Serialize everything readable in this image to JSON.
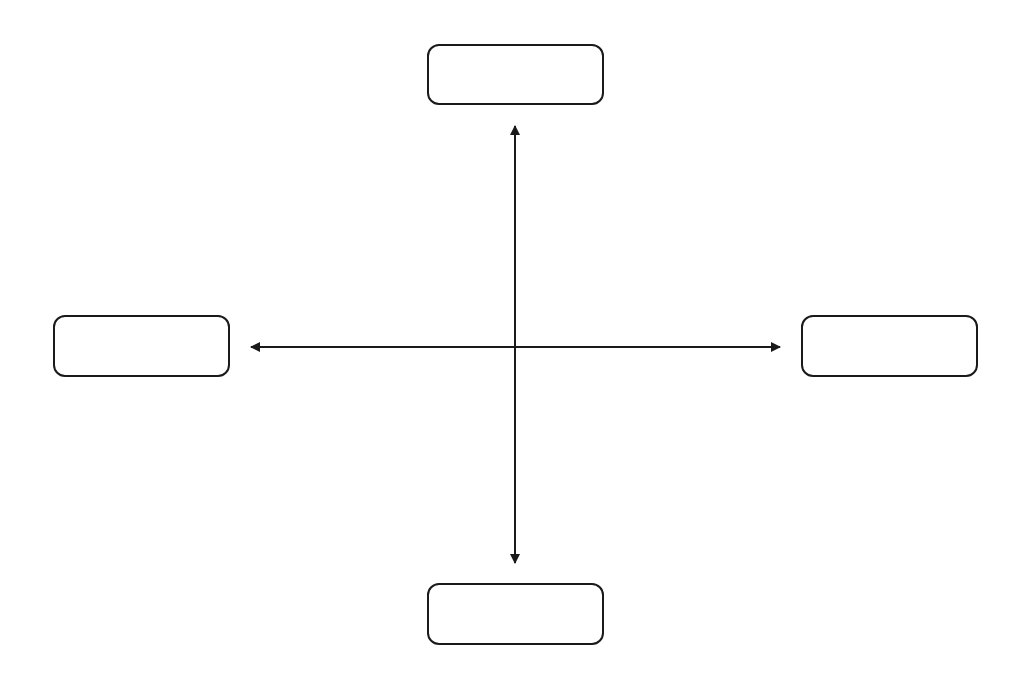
{
  "diagram": {
    "type": "cross-connector",
    "colors": {
      "stroke": "#1a1a1a",
      "background": "#ffffff"
    },
    "nodes": [
      {
        "id": "top",
        "label": ""
      },
      {
        "id": "left",
        "label": ""
      },
      {
        "id": "right",
        "label": ""
      },
      {
        "id": "bottom",
        "label": ""
      }
    ],
    "connectors": [
      {
        "id": "vertical",
        "from": "top",
        "to": "bottom",
        "style": "double-arrow"
      },
      {
        "id": "horizontal",
        "from": "left",
        "to": "right",
        "style": "double-arrow"
      }
    ]
  }
}
